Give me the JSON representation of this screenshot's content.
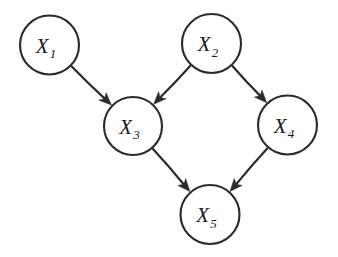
{
  "figure": {
    "kind": "directed-acyclic-graph",
    "background_color": "#ffffff",
    "stroke_color": "#2b2b2b",
    "label_color": "#1a1a1a",
    "node_fill": "#ffffff"
  },
  "nodes": [
    {
      "id": "X1",
      "base": "X",
      "subscript": "1",
      "label": "X1",
      "cx": 49.5,
      "cy": 45.0,
      "r": 29.5
    },
    {
      "id": "X2",
      "base": "X",
      "subscript": "2",
      "label": "X2",
      "cx": 211.5,
      "cy": 43.5,
      "r": 29.5
    },
    {
      "id": "X3",
      "base": "X",
      "subscript": "3",
      "label": "X3",
      "cx": 133.0,
      "cy": 126.0,
      "r": 29.0
    },
    {
      "id": "X4",
      "base": "X",
      "subscript": "4",
      "label": "X4",
      "cx": 287.5,
      "cy": 125.0,
      "r": 29.5
    },
    {
      "id": "X5",
      "base": "X",
      "subscript": "5",
      "label": "X5",
      "cx": 210.0,
      "cy": 214.5,
      "r": 29.5
    }
  ],
  "edges": [
    {
      "id": "e1",
      "from": "X1",
      "to": "X3",
      "directed": true
    },
    {
      "id": "e2",
      "from": "X2",
      "to": "X3",
      "directed": true
    },
    {
      "id": "e3",
      "from": "X2",
      "to": "X4",
      "directed": true
    },
    {
      "id": "e4",
      "from": "X3",
      "to": "X5",
      "directed": true
    },
    {
      "id": "e5",
      "from": "X4",
      "to": "X5",
      "directed": true
    }
  ]
}
